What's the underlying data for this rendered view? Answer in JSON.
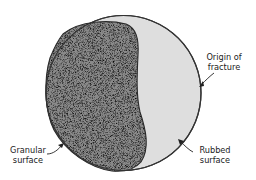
{
  "figure": {
    "regions": [
      {
        "id": "granular",
        "fill": "#7a7a7a"
      },
      {
        "id": "rubbed",
        "fill": "#dcdcdc"
      }
    ],
    "outline_color": "#333333"
  },
  "labels": {
    "origin": {
      "line1": "Origin of",
      "line2": "fracture"
    },
    "granular": {
      "line1": "Granular",
      "line2": "surface"
    },
    "rubbed": {
      "line1": "Rubbed",
      "line2": "surface"
    }
  }
}
